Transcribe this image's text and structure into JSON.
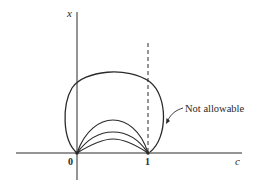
{
  "figure": {
    "axes": {
      "y_label": "x",
      "x_label": "c",
      "origin_label": "0",
      "unit_label": "1"
    },
    "annotation": {
      "text": "Not allowable"
    },
    "colors": {
      "stroke": "#2a2a2a",
      "background": "#ffffff"
    },
    "curves": {
      "outer_loop": "not allowable trajectory from 0 looping over past c=1",
      "inner_arcs_count": 3,
      "dashed_line_at": "c = 1"
    }
  }
}
